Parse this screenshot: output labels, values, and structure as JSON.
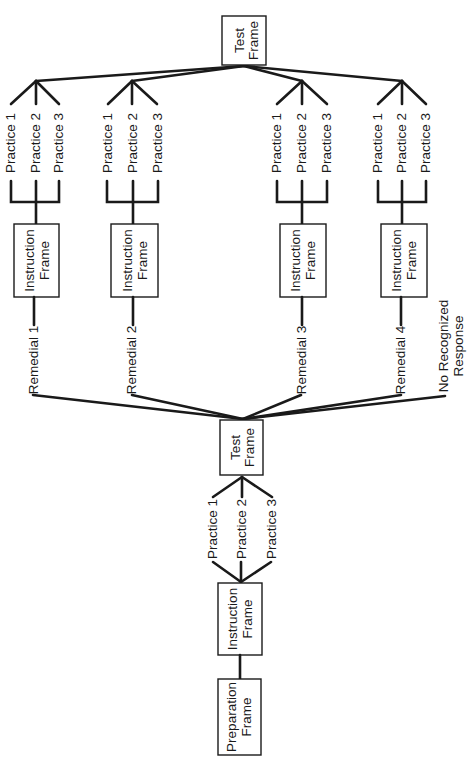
{
  "colors": {
    "ink": "#1a1a1a",
    "background": "#ffffff"
  },
  "diagram": {
    "orientation": "rotated-90-ccw",
    "top_test_frame": {
      "line1": "Test",
      "line2": "Frame"
    },
    "upper_branches": [
      {
        "practices": [
          "Practice 1",
          "Practice 2",
          "Practice 3"
        ],
        "instruction": {
          "line1": "Instruction",
          "line2": "Frame"
        },
        "remedial": "Remedial 1"
      },
      {
        "practices": [
          "Practice 1",
          "Practice 2",
          "Practice 3"
        ],
        "instruction": {
          "line1": "Instruction",
          "line2": "Frame"
        },
        "remedial": "Remedial 2"
      },
      {
        "practices": [
          "Practice 1",
          "Practice 2",
          "Practice 3"
        ],
        "instruction": {
          "line1": "Instruction",
          "line2": "Frame"
        },
        "remedial": "Remedial 3"
      },
      {
        "practices": [
          "Practice 1",
          "Practice 2",
          "Practice 3"
        ],
        "instruction": {
          "line1": "Instruction",
          "line2": "Frame"
        },
        "remedial": "Remedial 4"
      }
    ],
    "no_response": {
      "line1": "No Recognized",
      "line2": "Response"
    },
    "middle_test_frame": {
      "line1": "Test",
      "line2": "Frame"
    },
    "lower_practices": [
      "Practice 1",
      "Practice 2",
      "Practice 3"
    ],
    "lower_instruction": {
      "line1": "Instruction",
      "line2": "Frame"
    },
    "preparation": {
      "line1": "Preparation",
      "line2": "Frame"
    }
  }
}
